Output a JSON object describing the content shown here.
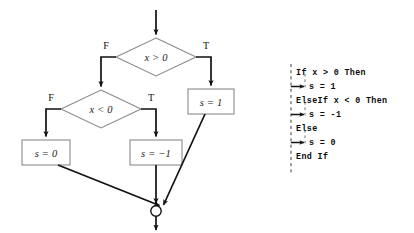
{
  "figure": {
    "type": "flowchart-with-pseudocode",
    "background_color": "#ffffff",
    "shape_stroke_color": "#8a8a8a",
    "arrow_color": "#111111",
    "text_color": "#1a1a1a"
  },
  "flowchart": {
    "entry_arrow": {
      "label": ""
    },
    "decisions": [
      {
        "id": "d1",
        "text": "x > 0",
        "false_label": "F",
        "true_label": "T"
      },
      {
        "id": "d2",
        "text": "x < 0",
        "false_label": "F",
        "true_label": "T"
      }
    ],
    "processes": [
      {
        "id": "p_s1",
        "text": "s = 1"
      },
      {
        "id": "p_s0",
        "text": "s = 0"
      },
      {
        "id": "p_sm1",
        "text": "s = −1"
      }
    ],
    "merge_node": {
      "shape": "circle",
      "label": ""
    },
    "exit_arrow": {
      "label": ""
    }
  },
  "code": {
    "lines": [
      {
        "indent": 0,
        "text": "If x > 0 Then",
        "arrow": false
      },
      {
        "indent": 1,
        "text": "s = 1",
        "arrow": true
      },
      {
        "indent": 0,
        "text": "ElseIf x < 0 Then",
        "arrow": false
      },
      {
        "indent": 1,
        "text": "s = -1",
        "arrow": true
      },
      {
        "indent": 0,
        "text": "Else",
        "arrow": false
      },
      {
        "indent": 1,
        "text": "s = 0",
        "arrow": true
      },
      {
        "indent": 0,
        "text": "End If",
        "arrow": false
      }
    ]
  }
}
